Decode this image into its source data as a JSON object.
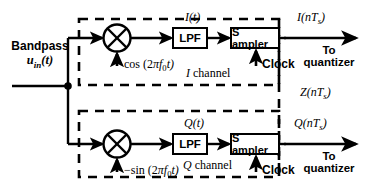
{
  "diagram": {
    "input": {
      "line1": "Bandpass",
      "line2_var": "u",
      "line2_sub": "in",
      "line2_tail": "(t)"
    },
    "i_channel": {
      "mixer_label": "multiplier",
      "lo_prefix": "cos (2",
      "lo_pi": "π",
      "lo_f": "f",
      "lo_sub": "0",
      "lo_tail": "t)",
      "lpf_label": "LPF",
      "mid_signal": "I(t)",
      "sampler_label": "S ampler",
      "clock_label": "Clock",
      "channel_label_letter": "I",
      "channel_label_word": " channel",
      "out_signal_main": "I(nT",
      "out_signal_sub": "s",
      "out_signal_tail": ")",
      "out_dest_line1": "To",
      "out_dest_line2": "quantizer"
    },
    "q_channel": {
      "mixer_label": "multiplier",
      "lo_prefix": "−sin (2",
      "lo_pi": "π",
      "lo_f": "f",
      "lo_sub": "0",
      "lo_tail": "t)",
      "lpf_label": "LPF",
      "mid_signal": "Q(t)",
      "sampler_label": "S ampler",
      "clock_label": "Clock",
      "channel_label_letter": "Q",
      "channel_label_word": " channel",
      "out_signal_main": "Q(nT",
      "out_signal_sub": "s",
      "out_signal_tail": ")",
      "out_dest_line1": "To",
      "out_dest_line2": "quantizer"
    },
    "combined_output": {
      "signal_main": "Z(nT",
      "signal_sub": "s",
      "signal_tail": ")"
    },
    "colors": {
      "stroke": "#000000",
      "background": "#ffffff"
    }
  }
}
